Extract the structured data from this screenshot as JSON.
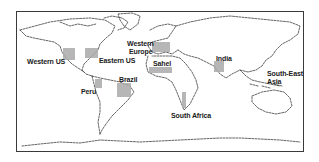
{
  "map": {
    "type": "world-outline-map",
    "frame": {
      "x": 16,
      "y": 11,
      "w": 288,
      "h": 141,
      "border_color": "#3a3a3a"
    },
    "highlight_color": "#a9a9a9",
    "regions": [
      {
        "id": "western-us",
        "label": "Western US",
        "box": {
          "x": 63,
          "y": 48,
          "w": 12,
          "h": 12
        },
        "label_pos": {
          "x": 27,
          "y": 58
        }
      },
      {
        "id": "eastern-us",
        "label": "Eastern US",
        "box": {
          "x": 85,
          "y": 48,
          "w": 13,
          "h": 10
        },
        "label_pos": {
          "x": 99,
          "y": 57
        }
      },
      {
        "id": "western-europe",
        "label_line1": "Western",
        "label_line2": "Europe",
        "box": {
          "x": 152,
          "y": 42,
          "w": 18,
          "h": 10
        },
        "label_pos": {
          "x": 127,
          "y": 40
        }
      },
      {
        "id": "sahel",
        "label": "Sahel",
        "box": {
          "x": 149,
          "y": 67,
          "w": 23,
          "h": 6
        },
        "label_pos": {
          "x": 153,
          "y": 60
        }
      },
      {
        "id": "peru",
        "label": "Peru",
        "box": {
          "x": 95,
          "y": 79,
          "w": 7,
          "h": 9
        },
        "label_pos": {
          "x": 81,
          "y": 88
        }
      },
      {
        "id": "brazil",
        "label": "Brazil",
        "box": {
          "x": 117,
          "y": 83,
          "w": 14,
          "h": 14
        },
        "label_pos": {
          "x": 119,
          "y": 76
        }
      },
      {
        "id": "south-africa",
        "label": "South Africa",
        "box": {
          "x": 182,
          "y": 92,
          "w": 4,
          "h": 16
        },
        "label_pos": {
          "x": 171,
          "y": 112
        }
      },
      {
        "id": "india",
        "label": "India",
        "box": {
          "x": 214,
          "y": 61,
          "w": 10,
          "h": 11
        },
        "label_pos": {
          "x": 216,
          "y": 55
        }
      },
      {
        "id": "south-east-asia",
        "label_line1": "South-East",
        "label_line2": "Asia",
        "box": null,
        "label_pos": {
          "x": 267,
          "y": 70
        }
      }
    ]
  },
  "labels": {
    "western_us": "Western US",
    "eastern_us": "Eastern US",
    "western_europe_1": "Western",
    "western_europe_2": "Europe",
    "sahel": "Sahel",
    "peru": "Peru",
    "brazil": "Brazil",
    "south_africa": "South Africa",
    "india": "India",
    "south_east_asia_1": "South-East",
    "south_east_asia_2": "Asia"
  }
}
